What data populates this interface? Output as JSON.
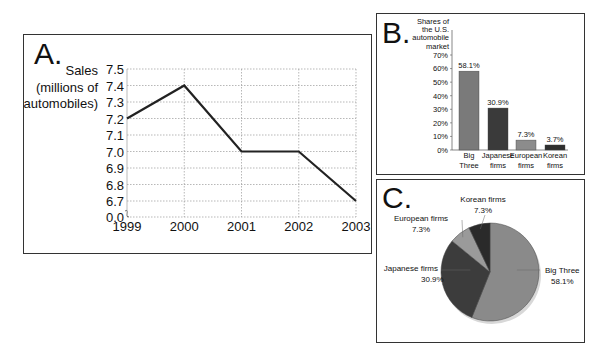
{
  "panels": {
    "a": {
      "letter": "A."
    },
    "b": {
      "letter": "B."
    },
    "c": {
      "letter": "C."
    }
  },
  "chart_data": [
    {
      "id": "A",
      "type": "line",
      "title": "",
      "xlabel": "",
      "ylabel": "Sales (millions of automobiles)",
      "ylabel_lines": [
        "Sales",
        "(millions of",
        "automobiles)"
      ],
      "x": [
        "1999",
        "2000",
        "2001",
        "2002",
        "2003"
      ],
      "values": [
        7.2,
        7.4,
        7.0,
        7.0,
        6.7
      ],
      "yticks": [
        "0.0",
        "6.7",
        "6.8",
        "6.9",
        "7.0",
        "7.1",
        "7.2",
        "7.3",
        "7.4",
        "7.5"
      ],
      "ylim": [
        6.6,
        7.5
      ],
      "axis_break": true,
      "grid": true
    },
    {
      "id": "B",
      "type": "bar",
      "title": "Shares of the U.S. automobile market",
      "title_lines": [
        "Shares of",
        "the U.S.",
        "automobile",
        "market"
      ],
      "categories": [
        "Big Three",
        "Japanese firms",
        "European firms",
        "Korean firms"
      ],
      "category_lines": [
        [
          "Big",
          "Three"
        ],
        [
          "Japanese",
          "firms"
        ],
        [
          "European",
          "firms"
        ],
        [
          "Korean",
          "firms"
        ]
      ],
      "values": [
        58.1,
        30.9,
        7.3,
        3.7
      ],
      "data_labels": [
        "58.1%",
        "30.9%",
        "7.3%",
        "3.7%"
      ],
      "yticks": [
        "0%",
        "10%",
        "20%",
        "30%",
        "40%",
        "50%",
        "60%",
        "70%"
      ],
      "ylim": [
        0,
        70
      ],
      "colors": [
        "#7a7a7a",
        "#3a3a3a",
        "#8c8c8c",
        "#2e2e2e"
      ]
    },
    {
      "id": "C",
      "type": "pie",
      "labels": [
        "Big Three",
        "Japanese firms",
        "European firms",
        "Korean firms"
      ],
      "values": [
        58.1,
        30.9,
        7.3,
        7.3
      ],
      "data_labels": [
        "58.1%",
        "30.9%",
        "7.3%",
        "7.3%"
      ],
      "colors": [
        "#8a8a8a",
        "#3c3c3c",
        "#9a9a9a",
        "#2a2a2a"
      ]
    }
  ]
}
